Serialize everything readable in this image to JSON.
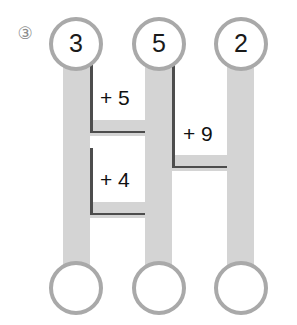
{
  "problem": {
    "number_glyph": "③",
    "number": 3
  },
  "diagram": {
    "type": "bar-comparison-worksheet",
    "colors": {
      "bar_fill": "#d4d4d4",
      "circle_stroke": "#a9a9a9",
      "brace_line": "#4d4d4d",
      "text": "#111111",
      "background": "#ffffff"
    },
    "columns": [
      {
        "id": "column-1",
        "top_circle_value": "3",
        "bottom_circle_value": "",
        "bar": {
          "x": 63,
          "y": 62,
          "width": 27,
          "height": 208
        }
      },
      {
        "id": "column-2",
        "top_circle_value": "5",
        "bottom_circle_value": "",
        "bar": {
          "x": 145,
          "y": 62,
          "width": 27,
          "height": 208
        }
      },
      {
        "id": "column-3",
        "top_circle_value": "2",
        "bottom_circle_value": "",
        "bar": {
          "x": 227,
          "y": 62,
          "width": 27,
          "height": 208
        }
      }
    ],
    "top_circles": [
      {
        "label": "3",
        "cx": 76,
        "cy": 44,
        "r": 27
      },
      {
        "label": "5",
        "cx": 159,
        "cy": 44,
        "r": 27
      },
      {
        "label": "2",
        "cx": 241,
        "cy": 44,
        "r": 27
      }
    ],
    "bottom_circles": [
      {
        "label": "",
        "cx": 76,
        "cy": 288,
        "r": 27
      },
      {
        "label": "",
        "cx": 159,
        "cy": 288,
        "r": 27
      },
      {
        "label": "",
        "cx": 241,
        "cy": 288,
        "r": 27
      }
    ],
    "connectors": [
      {
        "id": "connector-upper-left",
        "x": 63,
        "y": 120,
        "width": 109,
        "height": 16
      },
      {
        "id": "connector-lower-left",
        "x": 63,
        "y": 202,
        "width": 109,
        "height": 16
      },
      {
        "id": "connector-right",
        "x": 145,
        "y": 155,
        "width": 109,
        "height": 16
      }
    ],
    "annotations": [
      {
        "id": "delta-plus-5",
        "label": "+ 5",
        "between": [
          "column-1",
          "column-2"
        ],
        "x": 100,
        "y": 87,
        "brace": {
          "left": 90,
          "right": 145,
          "top": 62,
          "bottom": 133
        }
      },
      {
        "id": "delta-plus-4",
        "label": "+ 4",
        "between": [
          "column-1",
          "column-2"
        ],
        "x": 100,
        "y": 169,
        "brace": {
          "left": 90,
          "right": 145,
          "top": 148,
          "bottom": 215
        }
      },
      {
        "id": "delta-plus-9",
        "label": "+ 9",
        "between": [
          "column-2",
          "column-3"
        ],
        "x": 183,
        "y": 123,
        "brace": {
          "left": 172,
          "right": 227,
          "top": 62,
          "bottom": 168
        }
      }
    ]
  }
}
